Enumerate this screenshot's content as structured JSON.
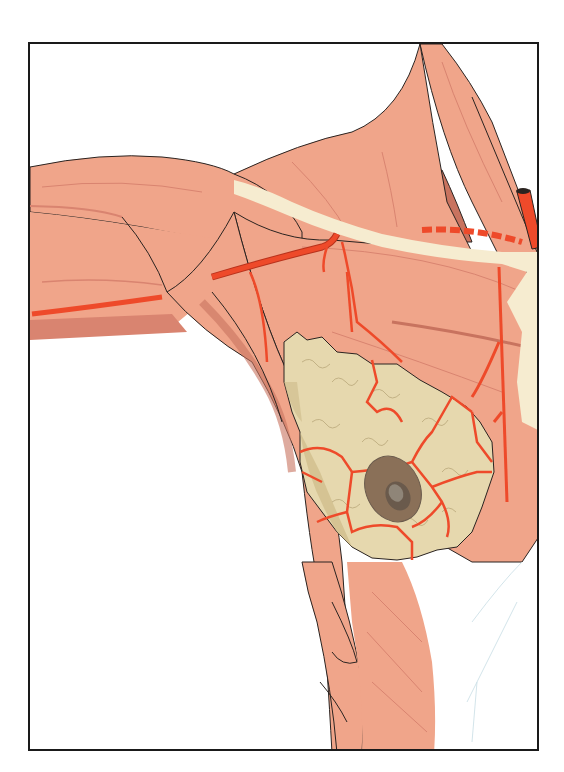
{
  "figure": {
    "title": "Anatomical illustration: arterial blood supply of the breast over the pectoral muscles",
    "labels": [],
    "colors": {
      "muscle": "#f0a58a",
      "muscle_shadow": "#d98470",
      "muscle_deep": "#c8735f",
      "fascia_cream": "#f6ecd0",
      "gland": "#e6d8ae",
      "gland_shadow": "#cdbb88",
      "artery": "#ee4a2a",
      "artery_dark": "#b8321c",
      "areola": "#8a7058",
      "nipple": "#6a5a4c",
      "outline": "#2a2320",
      "frame": "#1a1a1a",
      "background": "#ffffff"
    },
    "structures": [
      "deltoid-muscle",
      "arm-muscles",
      "pectoralis-major",
      "pectoralis-minor",
      "latissimus-dorsi",
      "serratus-anterior",
      "clavicle-fascia-band",
      "mammary-gland",
      "areola",
      "nipple",
      "axillary-artery",
      "lateral-thoracic-artery",
      "internal-thoracic-artery",
      "thoracoacromial-branches",
      "subclavian-artery-stump"
    ]
  }
}
